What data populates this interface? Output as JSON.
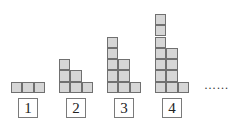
{
  "figures": [
    {
      "label": "1",
      "columns": [
        1,
        1,
        1
      ],
      "x": 11
    },
    {
      "label": "2",
      "columns": [
        3,
        2,
        1
      ],
      "x": 59
    },
    {
      "label": "3",
      "columns": [
        5,
        3,
        1
      ],
      "x": 107
    },
    {
      "label": "4",
      "columns": [
        7,
        4,
        1
      ],
      "x": 155
    }
  ],
  "ellipsis": "……",
  "colors": {
    "cell_fill": "#d6d6d6",
    "cell_border": "#707070"
  }
}
